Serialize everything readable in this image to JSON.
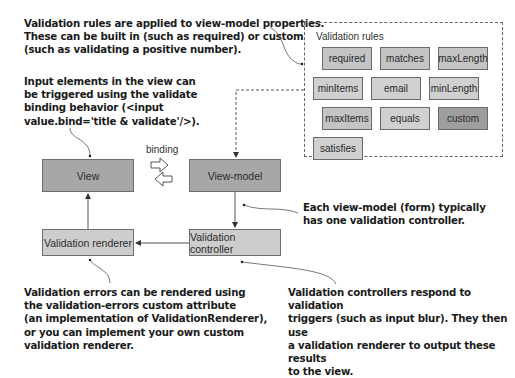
{
  "notes": {
    "rules_note": "Validation rules are applied to view-model properties.\nThese can be built in (such as required) or custom\n(such as validating a positive number).",
    "input_note": "Input elements in the view can\nbe triggered using the validate\nbinding behavior (<input\nvalue.bind='title & validate'/>).",
    "controller_per_form_note": "Each view-model (form) typically\nhas one validation controller.",
    "renderer_note": "Validation errors can be rendered using\nthe validation-errors custom attribute\n(an implementation of ValidationRenderer),\nor you can implement your own custom\nvalidation renderer.",
    "controller_note": "Validation controllers respond to validation\ntriggers (such as input blur). They then use\na validation renderer to output these results\nto the view."
  },
  "rules_panel": {
    "title": "Validation rules",
    "rules": [
      {
        "label": "required"
      },
      {
        "label": "matches"
      },
      {
        "label": "maxLength"
      },
      {
        "label": "minItems"
      },
      {
        "label": "email"
      },
      {
        "label": "minLength"
      },
      {
        "label": "maxItems"
      },
      {
        "label": "equals"
      },
      {
        "label": "custom"
      },
      {
        "label": "satisfies"
      }
    ]
  },
  "nodes": {
    "view": "View",
    "view_model": "View-model",
    "validation_renderer": "Validation renderer",
    "validation_controller": "Validation controller"
  },
  "binding_label": "binding",
  "colors": {
    "node_dark": "#a7a7a7",
    "node_light": "#cdcdcd",
    "rule_fill": "#c4c4c4",
    "rule_custom": "#9e9e9e",
    "line": "#555555"
  }
}
